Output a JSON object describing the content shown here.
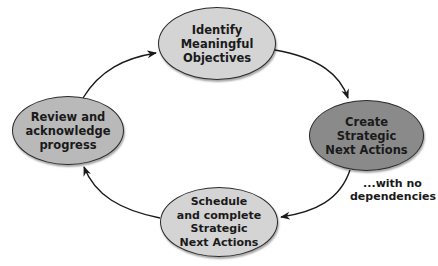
{
  "diagram": {
    "type": "cycle",
    "colors": {
      "light_node": "#d4d4d4",
      "medium_node": "#b9b9b9",
      "dark_node": "#8a8a8a",
      "stroke": "#2a2a2a"
    },
    "nodes": [
      {
        "id": "identify",
        "label": "Identify\nMeaningful\nObjectives"
      },
      {
        "id": "create",
        "label": "Create\nStrategic\nNext Actions"
      },
      {
        "id": "schedule",
        "label": "Schedule\nand complete\nStrategic\nNext Actions"
      },
      {
        "id": "review",
        "label": "Review and\nacknowledge\nprogress"
      }
    ],
    "edges": [
      {
        "from": "identify",
        "to": "create"
      },
      {
        "from": "create",
        "to": "schedule",
        "label": "...with no\ndependencies"
      },
      {
        "from": "schedule",
        "to": "review"
      },
      {
        "from": "review",
        "to": "identify"
      }
    ],
    "annotation": "...with no\ndependencies"
  }
}
